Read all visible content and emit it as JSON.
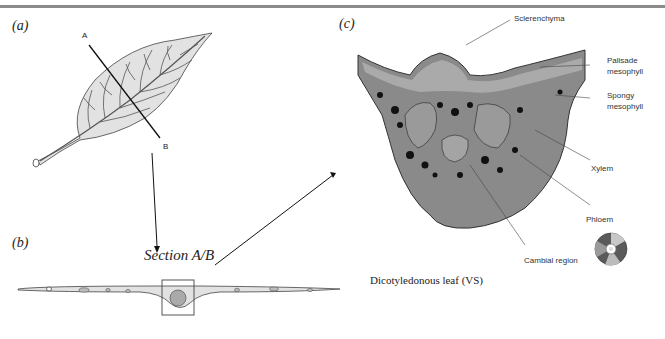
{
  "header": {
    "running_text": ""
  },
  "panels": {
    "a": {
      "label": "(a)",
      "points": {
        "A": "A",
        "B": "B"
      }
    },
    "b": {
      "label": "(b)",
      "section_label": "Section A/B"
    },
    "c": {
      "label": "(c)",
      "caption": "Dicotyledonous leaf (VS)",
      "annotations": {
        "sclerenchyma": "Sclerenchyma",
        "palisade_1": "Palisade",
        "palisade_2": "mesophyll",
        "spongy_1": "Spongy",
        "spongy_2": "mesophyll",
        "xylem": "Xylem",
        "phloem": "Phloem",
        "cambial": "Cambial region"
      }
    }
  },
  "colors": {
    "leaf_fill": "#e2e2e2",
    "line": "#222222",
    "micrograph": "#6a6a6a",
    "rule": "#8a8a8a"
  }
}
